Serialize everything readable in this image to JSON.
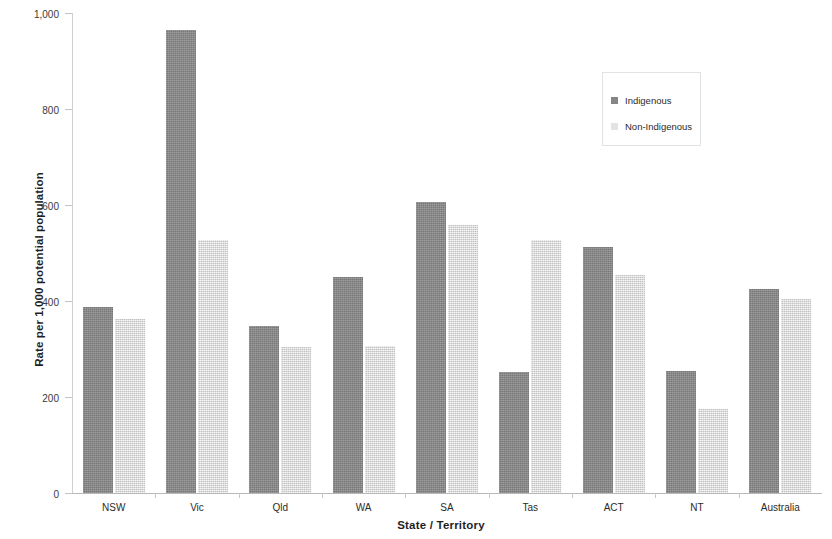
{
  "chart_data": {
    "type": "bar",
    "title": "",
    "xlabel": "State / Territory",
    "ylabel": "Rate per 1,000 potential population",
    "ylim": [
      0,
      1000
    ],
    "yticks": [
      0,
      200,
      400,
      600,
      800,
      1000
    ],
    "ytick_labels": [
      "0",
      "200",
      "400",
      "600",
      "800",
      "1,000"
    ],
    "grid": false,
    "legend_position": "upper right",
    "categories": [
      "NSW",
      "Vic",
      "Qld",
      "WA",
      "SA",
      "Tas",
      "ACT",
      "NT",
      "Australia"
    ],
    "series": [
      {
        "name": "Indigenous",
        "color": "#868686",
        "values": [
          388,
          964,
          348,
          450,
          606,
          252,
          513,
          254,
          424
        ]
      },
      {
        "name": "Non-Indigenous",
        "color": "#dedede",
        "values": [
          363,
          527,
          304,
          307,
          559,
          528,
          455,
          175,
          404
        ]
      }
    ]
  },
  "legend": {
    "entries": [
      {
        "label": "Indigenous",
        "swatch": "indigenous"
      },
      {
        "label": "Non-Indigenous",
        "swatch": "nonindigenous"
      }
    ]
  }
}
